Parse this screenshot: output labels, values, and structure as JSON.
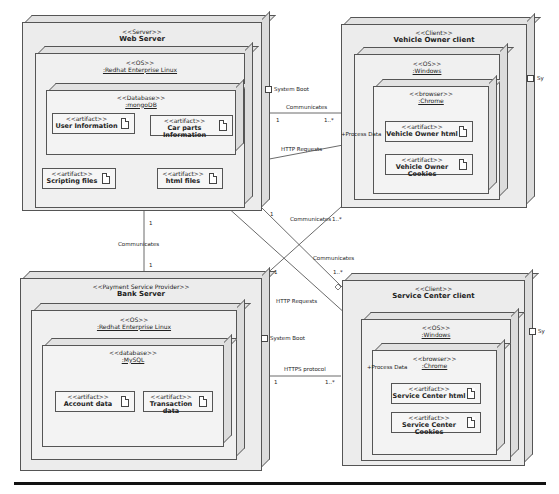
{
  "diagram": {
    "type": "UML deployment diagram",
    "nodes": {
      "web_server": {
        "stereotype": "<<Server>>",
        "name": "Web Server",
        "os": {
          "stereotype": "<<OS>>",
          "name": ":Redhat Enterprise Linux"
        },
        "database": {
          "stereotype": "<<Database>>",
          "name": ":mongoDB"
        },
        "artifacts": [
          {
            "stereotype": "<<artifact>>",
            "name": "User Information"
          },
          {
            "stereotype": "<<artifact>>",
            "name": "Car parts Information"
          },
          {
            "stereotype": "<<artifact>>",
            "name": "Scripting files"
          },
          {
            "stereotype": "<<artifact>>",
            "name": "html files"
          }
        ],
        "port_label": "System Boot"
      },
      "vehicle_owner_client": {
        "stereotype": "<<Client>>",
        "name": "Vehicle Owner client",
        "os": {
          "stereotype": "<<OS>>",
          "name": ":Windows"
        },
        "browser": {
          "stereotype": "<<browser>>",
          "name": ":Chrome"
        },
        "artifacts": [
          {
            "stereotype": "<<artifact>>",
            "name": "Vehicle Owner html"
          },
          {
            "stereotype": "<<artifact>>",
            "name": "Vehicle Owner Cookies"
          }
        ],
        "port_label": "Sy"
      },
      "bank_server": {
        "stereotype": "<<Payment Service Provider>>",
        "name": "Bank Server",
        "os": {
          "stereotype": "<<OS>>",
          "name": ":Redhat Enterprise Linux"
        },
        "database": {
          "stereotype": "<<database>>",
          "name": ":MySQL"
        },
        "artifacts": [
          {
            "stereotype": "<<artifact>>",
            "name": "Account data"
          },
          {
            "stereotype": "<<artifact>>",
            "name": "Transaction data"
          }
        ],
        "port_label": "System Boot"
      },
      "service_center_client": {
        "stereotype": "<<Client>>",
        "name": "Service Center client",
        "os": {
          "stereotype": "<<OS>>",
          "name": ":Windows"
        },
        "browser": {
          "stereotype": "<<browser>>",
          "name": ":Chrome"
        },
        "artifacts": [
          {
            "stereotype": "<<artifact>>",
            "name": "Service Center html"
          },
          {
            "stereotype": "<<artifact>>",
            "name": "Service Center Cookies"
          }
        ],
        "port_label": "Sy"
      }
    },
    "connections": {
      "web_vehicle": {
        "label": "Communicates",
        "mult_a": "1",
        "mult_b": "1..*"
      },
      "web_bank": {
        "label": "Communicates",
        "mult_a": "1",
        "mult_b": "1"
      },
      "web_service": {
        "label": "Communicates",
        "mult_a": "1",
        "mult_b": "1..*"
      },
      "bank_vehicle": {
        "label": "Communicates",
        "mult_a": "1",
        "mult_b": "1..*"
      },
      "bank_service": {
        "label": "HTTPS protocol",
        "mult_a": "1",
        "mult_b": "1..*"
      },
      "http_vehicle": {
        "label": "HTTP Requests",
        "target_label": "+Process Data"
      },
      "http_service": {
        "label": "HTTP Requests",
        "target_label": "+Process Data"
      }
    }
  }
}
